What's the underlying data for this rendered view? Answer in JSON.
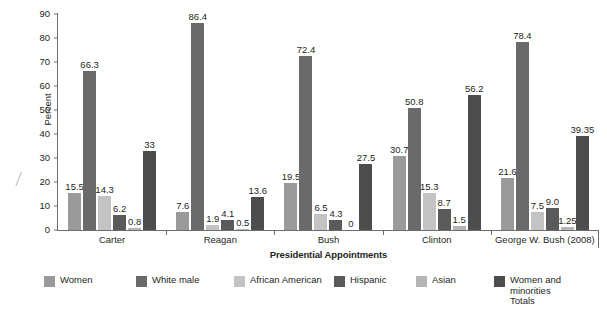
{
  "chart_data": {
    "type": "bar",
    "title": "",
    "xlabel": "Presidential Appointments",
    "ylabel": "Percent",
    "ylim": [
      0,
      90
    ],
    "yticks": [
      0,
      10,
      20,
      30,
      40,
      50,
      60,
      70,
      80,
      90
    ],
    "grid": false,
    "legend_position": "bottom",
    "categories": [
      "Carter",
      "Reagan",
      "Bush",
      "Clinton",
      "George W. Bush (2008)"
    ],
    "series": [
      {
        "name": "Women",
        "color": "#9a9a9a",
        "values": [
          15.5,
          7.6,
          19.5,
          30.7,
          21.6
        ],
        "labels": [
          "15.5",
          "7.6",
          "19.5",
          "30.7",
          "21.6"
        ]
      },
      {
        "name": "White male",
        "color": "#6a6a6a",
        "values": [
          66.3,
          86.4,
          72.4,
          50.8,
          78.4
        ],
        "labels": [
          "66.3",
          "86.4",
          "72.4",
          "50.8",
          "78.4"
        ]
      },
      {
        "name": "African American",
        "color": "#c3c3c3",
        "values": [
          14.3,
          1.9,
          6.5,
          15.3,
          7.5
        ],
        "labels": [
          "14.3",
          "1.9",
          "6.5",
          "15.3",
          "7.5"
        ]
      },
      {
        "name": "Hispanic",
        "color": "#5a5a5a",
        "values": [
          6.2,
          4.1,
          4.3,
          8.7,
          9.0
        ],
        "labels": [
          "6.2",
          "4.1",
          "4.3",
          "8.7",
          "9.0"
        ]
      },
      {
        "name": "Asian",
        "color": "#b5b5b5",
        "values": [
          0.8,
          0.5,
          0,
          1.5,
          1.25
        ],
        "labels": [
          "0.8",
          "0.5",
          "0",
          "1.5",
          "1.25"
        ]
      },
      {
        "name": "Women and minorities\nTotals",
        "color": "#4d4d4d",
        "values": [
          33,
          13.6,
          27.5,
          56.2,
          39.35
        ],
        "labels": [
          "33",
          "13.6",
          "27.5",
          "56.2",
          "39.35"
        ]
      }
    ]
  },
  "axis": {
    "y_title": "Percent",
    "x_title": "Presidential Appointments",
    "tick_0": "0",
    "tick_10": "10",
    "tick_20": "20",
    "tick_30": "30",
    "tick_40": "40",
    "tick_50": "50",
    "tick_60": "60",
    "tick_70": "70",
    "tick_80": "80",
    "tick_90": "90"
  }
}
